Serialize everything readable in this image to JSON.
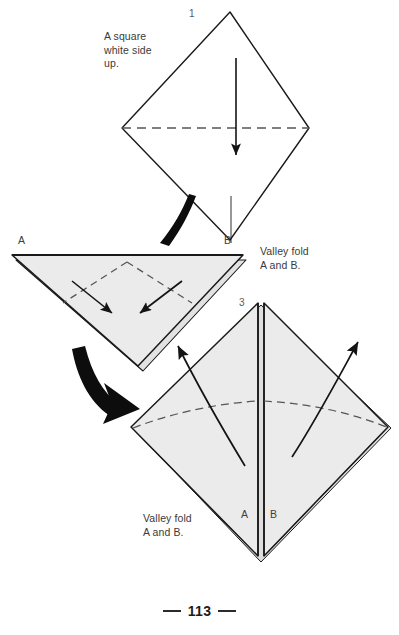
{
  "page": {
    "number": "113",
    "background_color": "#ffffff",
    "paper_fill": "#ebebeb",
    "line_color": "#1a1a1a",
    "fold_line_color": "#555555",
    "arrow_color": "#141414"
  },
  "steps": [
    {
      "id": "step-1",
      "number": "1",
      "caption": "A square\nwhite side\nup.",
      "point_labels": [
        "B"
      ],
      "fold_type": "valley",
      "arrow_direction": "down"
    },
    {
      "id": "step-2",
      "number": "2",
      "caption": "Valley fold\nA and B.",
      "point_labels": [
        "A",
        "B"
      ],
      "fold_type": "valley",
      "arrow_direction": "inward-down"
    },
    {
      "id": "step-3",
      "number": "3",
      "caption": "Valley fold\nA and B.",
      "point_labels": [
        "A",
        "B"
      ],
      "fold_type": "valley",
      "arrow_direction": "outward-up"
    }
  ],
  "labels": {
    "step1_number": "1",
    "step3_number": "3",
    "step1_caption": "A square\nwhite side\nup.",
    "step2_caption": "Valley fold\nA and B.",
    "step3_caption": "Valley fold\nA and B.",
    "step1_point_b": "B",
    "step2_point_a": "A",
    "step2_point_b": "B",
    "step3_point_a": "A",
    "step3_point_b": "B"
  }
}
